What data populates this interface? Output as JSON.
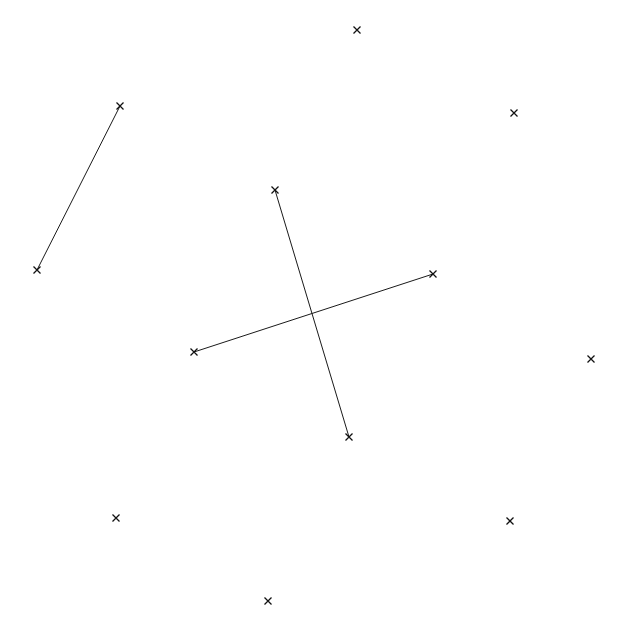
{
  "figure": {
    "title": "",
    "background_color": "#ffffff",
    "width": 630,
    "height": 625,
    "marker_glyph": "x",
    "marker_color": "#111111",
    "line_color": "#1a1a1a",
    "line_width": 1,
    "marker_size": 7
  },
  "chart_data": {
    "type": "scatter",
    "title": "",
    "xlabel": "",
    "ylabel": "",
    "xlim": [
      0,
      630
    ],
    "ylim": [
      0,
      625
    ],
    "grid": false,
    "legend": null,
    "axes_visible": false,
    "tick_labels": {
      "x": [],
      "y": []
    },
    "coordinate_system": "pixel (origin top-left)",
    "marker_style": "x",
    "points": [
      {
        "id": "p1",
        "x": 120,
        "y": 106,
        "connected": true,
        "label": ""
      },
      {
        "id": "p2",
        "x": 37,
        "y": 270,
        "connected": true,
        "label": ""
      },
      {
        "id": "p3",
        "x": 275,
        "y": 190,
        "connected": true,
        "label": ""
      },
      {
        "id": "p4",
        "x": 349,
        "y": 437,
        "connected": true,
        "label": ""
      },
      {
        "id": "p5",
        "x": 194,
        "y": 352,
        "connected": true,
        "label": ""
      },
      {
        "id": "p6",
        "x": 433,
        "y": 274,
        "connected": true,
        "label": ""
      },
      {
        "id": "p7",
        "x": 357,
        "y": 30,
        "connected": false,
        "label": ""
      },
      {
        "id": "p8",
        "x": 514,
        "y": 113,
        "connected": false,
        "label": ""
      },
      {
        "id": "p9",
        "x": 591,
        "y": 359,
        "connected": false,
        "label": ""
      },
      {
        "id": "p10",
        "x": 116,
        "y": 518,
        "connected": false,
        "label": ""
      },
      {
        "id": "p11",
        "x": 510,
        "y": 521,
        "connected": false,
        "label": ""
      },
      {
        "id": "p12",
        "x": 268,
        "y": 601,
        "connected": false,
        "label": ""
      }
    ],
    "segments": [
      {
        "id": "s1",
        "from": "p1",
        "to": "p2",
        "x1": 120,
        "y1": 106,
        "x2": 37,
        "y2": 270
      },
      {
        "id": "s2",
        "from": "p3",
        "to": "p4",
        "x1": 275,
        "y1": 190,
        "x2": 349,
        "y2": 437
      },
      {
        "id": "s3",
        "from": "p5",
        "to": "p6",
        "x1": 194,
        "y1": 352,
        "x2": 433,
        "y2": 274
      }
    ],
    "counts": {
      "total_points": 12,
      "connected_points": 6,
      "isolated_points": 6,
      "segments": 3
    }
  }
}
